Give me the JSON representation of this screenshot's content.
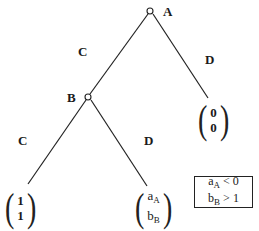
{
  "diagram": {
    "type": "game-tree",
    "nodes": [
      {
        "id": "A",
        "label": "A",
        "x": 150,
        "y": 11
      },
      {
        "id": "B",
        "label": "B",
        "x": 88,
        "y": 97
      }
    ],
    "edges": [
      {
        "from": "A",
        "to": "B",
        "label": "C"
      },
      {
        "from": "A",
        "to": "leaf_00",
        "label": "D"
      },
      {
        "from": "B",
        "to": "leaf_11",
        "label": "C"
      },
      {
        "from": "B",
        "to": "leaf_ab",
        "label": "D"
      }
    ],
    "leaves": {
      "leaf_00": {
        "top": "0",
        "bottom": "0"
      },
      "leaf_11": {
        "top": "1",
        "bottom": "1"
      },
      "leaf_ab": {
        "top_base": "a",
        "top_sub": "A",
        "bottom_base": "b",
        "bottom_sub": "B"
      }
    },
    "condition_box": {
      "line1_base": "a",
      "line1_sub": "A",
      "line1_rest": " < 0",
      "line2_base": "b",
      "line2_sub": "B",
      "line2_rest": " > 1"
    },
    "labels": {
      "node_a": "A",
      "node_b": "B",
      "edge_ab": "C",
      "edge_a_leaf": "D",
      "edge_b_left": "C",
      "edge_b_right": "D",
      "paren_open": "(",
      "paren_close": ")"
    },
    "colors": {
      "line": "#222222",
      "background": "#ffffff"
    }
  }
}
